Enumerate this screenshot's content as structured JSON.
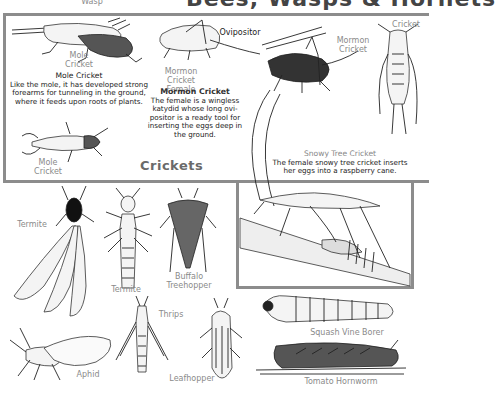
{
  "header": {
    "wasp_label": "Wasp",
    "title": "Bees, Wasps & Hornets"
  },
  "crickets_panel": {
    "section_title": "Crickets",
    "labels": {
      "mole_cricket_top": "Mole Cricket",
      "mole_cricket_bottom": "Mole Cricket",
      "mormon_cricket_female": "Mormon Cricket Female",
      "ovipositor": "Ovipositor",
      "mormon_cricket": "Mormon Cricket",
      "cricket": "Cricket"
    },
    "mole_cricket_caption": {
      "title": "Mole Cricket",
      "body": "Like the mole, it has developed strong forearms for tunneling in the ground, where it feeds upon roots of plants."
    },
    "mormon_cricket_caption": {
      "title": "Mormon Cricket",
      "body": "The female is a wingless katydid whose long ovi-positor is a ready tool for inserting the eggs deep in the ground."
    }
  },
  "snowy_tree_cricket": {
    "title": "Snowy Tree Cricket",
    "body": "The female snowy tree cricket inserts her eggs into a raspberry cane."
  },
  "insects": {
    "termite_winged": "Termite",
    "termite_worker": "Termite",
    "buffalo_treehopper": "Buffalo Treehopper",
    "thrips": "Thrips",
    "aphid": "Aphid",
    "leafhopper": "Leafhopper",
    "squash_vine_borer": "Squash Vine Borer",
    "tomato_hornworm": "Tomato Hornworm"
  },
  "colors": {
    "frame": "#8c8c8c",
    "label_gray": "#8a8a8a",
    "ink": "#222222"
  }
}
